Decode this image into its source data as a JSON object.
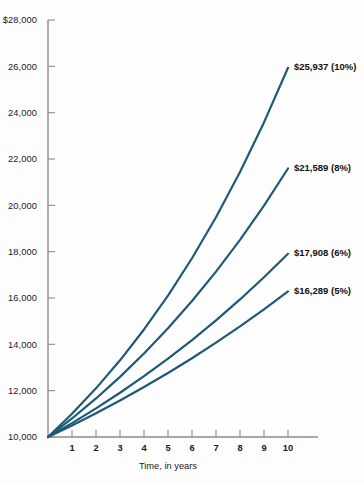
{
  "chart_data": {
    "type": "line",
    "title": "",
    "subtitle": "",
    "xlabel": "Time, in years",
    "ylabel": "",
    "xlim": [
      0,
      10
    ],
    "ylim": [
      10000,
      28000
    ],
    "grid": false,
    "legend_position": "inline-right-annotations",
    "x": [
      0,
      1,
      2,
      3,
      4,
      5,
      6,
      7,
      8,
      9,
      10
    ],
    "x_tick_labels": [
      "1",
      "2",
      "3",
      "4",
      "5",
      "6",
      "7",
      "8",
      "9",
      "10"
    ],
    "y_tick_labels": [
      "$28,000",
      "26,000",
      "24,000",
      "22,000",
      "20,000",
      "18,000",
      "16,000",
      "14,000",
      "12,000",
      "10,000"
    ],
    "y_tick_values": [
      28000,
      26000,
      24000,
      22000,
      20000,
      18000,
      16000,
      14000,
      12000,
      10000
    ],
    "line_color": "#1d5a78",
    "axis_color": "#8c8c8c",
    "series": [
      {
        "name": "10%",
        "rate_percent": 10,
        "annotation": "$25,937 (10%)",
        "final_value": 25937,
        "values": [
          10000,
          11000,
          12100,
          13310,
          14641,
          16105,
          17716,
          19487,
          21436,
          23579,
          25937
        ]
      },
      {
        "name": "8%",
        "rate_percent": 8,
        "annotation": "$21,589 (8%)",
        "final_value": 21589,
        "values": [
          10000,
          10800,
          11664,
          12597,
          13605,
          14693,
          15869,
          17138,
          18509,
          19990,
          21589
        ]
      },
      {
        "name": "6%",
        "rate_percent": 6,
        "annotation": "$17,908 (6%)",
        "final_value": 17908,
        "values": [
          10000,
          10600,
          11236,
          11910,
          12625,
          13382,
          14185,
          15036,
          15938,
          16895,
          17908
        ]
      },
      {
        "name": "5%",
        "rate_percent": 5,
        "annotation": "$16,289 (5%)",
        "final_value": 16289,
        "values": [
          10000,
          10500,
          11025,
          11576,
          12155,
          12763,
          13401,
          14071,
          14775,
          15513,
          16289
        ]
      }
    ]
  }
}
